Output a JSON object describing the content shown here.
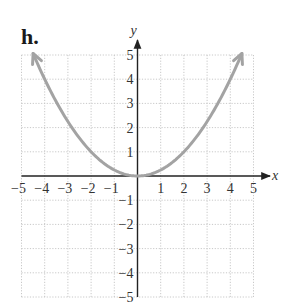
{
  "part_label": "h.",
  "colors": {
    "curve": "#a3a3a3",
    "axis": "#222222",
    "grid": "#c8c8c8",
    "text": "#333333"
  },
  "chart_data": {
    "type": "line",
    "title": "",
    "xlabel": "x",
    "ylabel": "y",
    "xlim": [
      -5,
      5
    ],
    "ylim": [
      -5,
      5
    ],
    "grid": true,
    "x_ticks": [
      -5,
      -4,
      -3,
      -2,
      -1,
      1,
      2,
      3,
      4,
      5
    ],
    "y_ticks": [
      -5,
      -4,
      -3,
      -2,
      -1,
      1,
      2,
      3,
      4,
      5
    ],
    "x_tick_labels": [
      "−5",
      "−4",
      "−3",
      "−2",
      "−1",
      "1",
      "2",
      "3",
      "4",
      "5"
    ],
    "y_tick_labels": [
      "−5",
      "−4",
      "−3",
      "−2",
      "−1",
      "1",
      "2",
      "3",
      "4",
      "5"
    ],
    "series": [
      {
        "name": "y = x²/4",
        "function": "x^2/4",
        "x_range": [
          -4.5,
          4.5
        ],
        "arrows_both_ends": true,
        "points": [
          [
            -4.5,
            5.06
          ],
          [
            -4,
            4
          ],
          [
            -3,
            2.25
          ],
          [
            -2,
            1
          ],
          [
            -1,
            0.25
          ],
          [
            0,
            0
          ],
          [
            1,
            0.25
          ],
          [
            2,
            1
          ],
          [
            3,
            2.25
          ],
          [
            4,
            4
          ],
          [
            4.5,
            5.06
          ]
        ]
      }
    ]
  }
}
